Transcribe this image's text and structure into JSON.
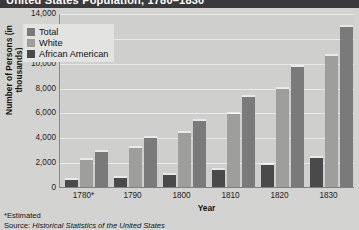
{
  "banner": {
    "title": "United States Population, 1780–1830"
  },
  "chart_data": {
    "type": "bar",
    "title": "United States Population, 1780–1830",
    "xlabel": "Year",
    "ylabel": "Number of Persons (in thousands)",
    "categories": [
      "1780*",
      "1790",
      "1800",
      "1810",
      "1820",
      "1830"
    ],
    "ylim": [
      0,
      14000
    ],
    "ytick_step": 2000,
    "ytick_labels": [
      "14,000",
      "12,000",
      "10,000",
      "8,000",
      "6,000",
      "4,000",
      "2,000",
      "0"
    ],
    "grid": true,
    "legend_position": "top-left",
    "series": [
      {
        "name": "African American",
        "color": "#4a4a4c",
        "values": [
          575,
          757,
          1002,
          1378,
          1772,
          2329
        ]
      },
      {
        "name": "White",
        "color": "#9e9e9c",
        "values": [
          2204,
          3172,
          4306,
          5862,
          7867,
          10537
        ]
      },
      {
        "name": "Total",
        "color": "#7a7a7a",
        "values": [
          2780,
          3929,
          5308,
          7240,
          9638,
          12866
        ]
      }
    ],
    "legend_order": [
      "Total",
      "White",
      "African American"
    ],
    "bar_order": [
      "African American",
      "White",
      "Total"
    ],
    "annotations": {
      "footnote": "*Estimated",
      "source_label": "Source: ",
      "source_title": "Historical Statistics of the United States"
    }
  },
  "colors": {
    "background": "#d3d3d1",
    "panel": "#cfcfcd",
    "gridline": "#e9e9e7",
    "banner": "#3a3a3c",
    "total": "#7a7a7a",
    "white": "#9e9e9c",
    "african_american": "#4a4a4c"
  }
}
